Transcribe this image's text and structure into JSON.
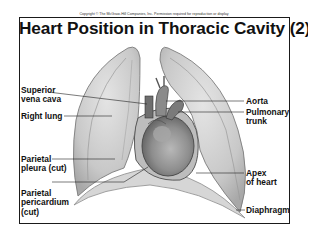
{
  "copyright": "Copyright © The McGraw-Hill Companies, Inc. Permission required for reproduction or display",
  "title": "Heart Position in Thoracic Cavity (2)",
  "labels": {
    "superior_vena_cava": {
      "line1": "Superior",
      "line2": "vena cava"
    },
    "right_lung": {
      "line1": "Right lung"
    },
    "parietal_pleura": {
      "line1": "Parietal",
      "line2": "pleura (cut)"
    },
    "parietal_pericardium": {
      "line1": "Parietal",
      "line2": "pericardium",
      "line3": "(cut)"
    },
    "aorta": {
      "line1": "Aorta"
    },
    "pulmonary_trunk": {
      "line1": "Pulmonary",
      "line2": "trunk"
    },
    "apex_of_heart": {
      "line1": "Apex",
      "line2": "of heart"
    },
    "diaphragm": {
      "line1": "Diaphragm"
    }
  },
  "colors": {
    "frame": "#1a1a1a",
    "lung_fill": "#cfcfcf",
    "lung_edge": "#8a8a8a",
    "heart_fill": "#9a9a9a",
    "leader_line": "#222222"
  }
}
